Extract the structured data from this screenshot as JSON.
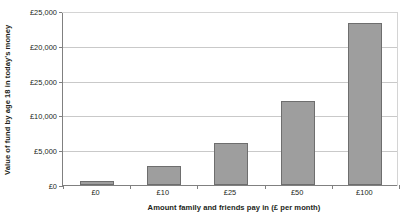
{
  "chart_data": {
    "type": "bar",
    "title": "",
    "xlabel": "Amount family and friends pay in (£ per month)",
    "ylabel": "Value of fund by age 18 in today's money",
    "categories": [
      "£0",
      "£10",
      "£25",
      "£50",
      "£100"
    ],
    "values": [
      600,
      2800,
      6100,
      12100,
      23300
    ],
    "ylim": [
      0,
      25000
    ],
    "ytick_values": [
      0,
      5000,
      10000,
      15000,
      20000,
      25000
    ],
    "ytick_labels": [
      "£0",
      "£5,000",
      "£10,000",
      "£25,000",
      "£20,000",
      "£25,000"
    ],
    "grid": true,
    "legend": false,
    "bar_color": "#9e9e9e",
    "bar_border_color": "#6e6e6e",
    "gridline_color": "#c9c9c9",
    "axis_color": "#808080",
    "text_color": "#231f20"
  }
}
